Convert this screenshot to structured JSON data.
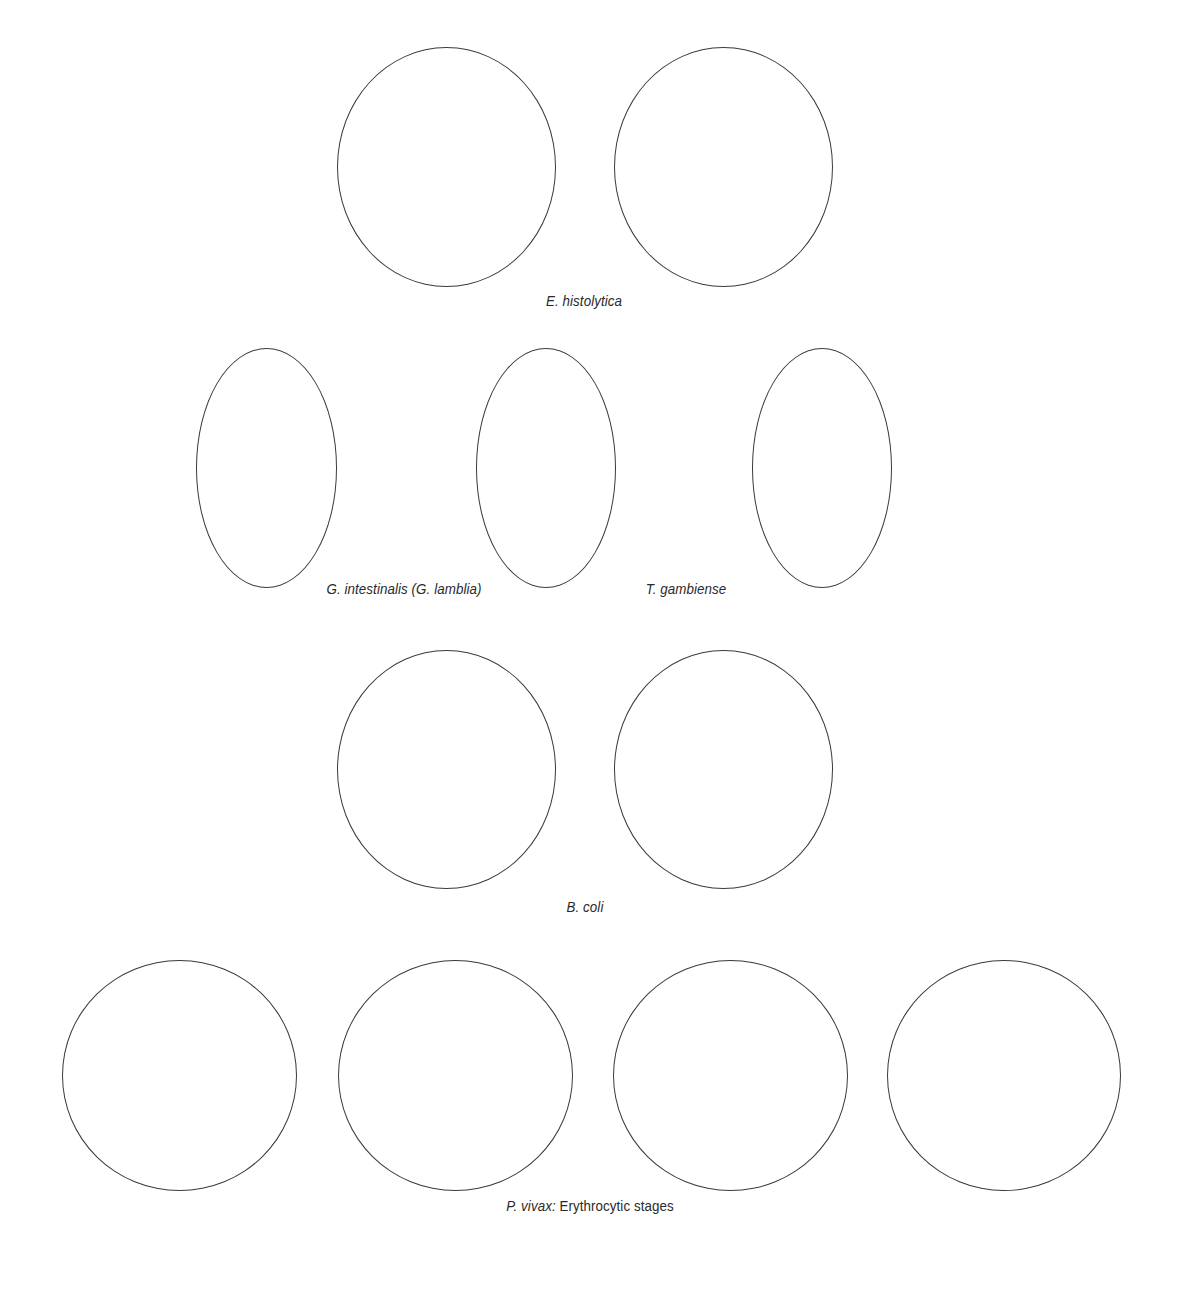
{
  "figures": [
    {
      "label": "E. histolytica",
      "cells": 2
    },
    {
      "labels": [
        "G. intestinalis (G. lamblia)",
        "T. gambiense"
      ],
      "cells": 3
    },
    {
      "label": "B. coli",
      "cells": 2
    },
    {
      "label_italic": "P. vivax:",
      "label_plain": " Erythrocytic stages",
      "cells": 4
    }
  ],
  "colors": {
    "outline": "#3a3a3a",
    "background": "#ffffff",
    "caption": "#2a2a2a"
  }
}
